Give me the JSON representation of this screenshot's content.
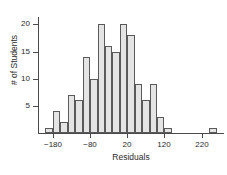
{
  "chart_data": {
    "type": "bar",
    "title": "",
    "xlabel": "Residuals",
    "ylabel": "# of Students",
    "bin_width": 20,
    "bin_starts": [
      -200,
      -180,
      -160,
      -140,
      -120,
      -100,
      -80,
      -60,
      -40,
      -20,
      0,
      20,
      40,
      60,
      80,
      100,
      120,
      240
    ],
    "categories": [
      "-200 to -180",
      "-180 to -160",
      "-160 to -140",
      "-140 to -120",
      "-120 to -100",
      "-100 to -80",
      "-80 to -60",
      "-60 to -40",
      "-40 to -20",
      "-20 to 0",
      "0 to 20",
      "20 to 40",
      "40 to 60",
      "60 to 80",
      "80 to 100",
      "100 to 120",
      "120 to 140",
      "240 to 260"
    ],
    "values": [
      1,
      4,
      2,
      7,
      6,
      14,
      10,
      20,
      16,
      15,
      20,
      18,
      9,
      6,
      9,
      3,
      1,
      1
    ],
    "xlim": [
      -220,
      280
    ],
    "ylim": [
      0,
      21
    ],
    "xticks": [
      -180,
      -80,
      20,
      120,
      220
    ],
    "xtick_labels": [
      "−180",
      "−80",
      "20",
      "120",
      "220"
    ],
    "yticks": [
      5,
      10,
      15,
      20
    ],
    "ytick_labels": [
      "5",
      "10",
      "15",
      "20"
    ],
    "grid": false,
    "legend": false,
    "bar_fill": "#e4e4e4",
    "bar_edge": "#5a5a5a",
    "axis_color": "#4a4a4a"
  }
}
